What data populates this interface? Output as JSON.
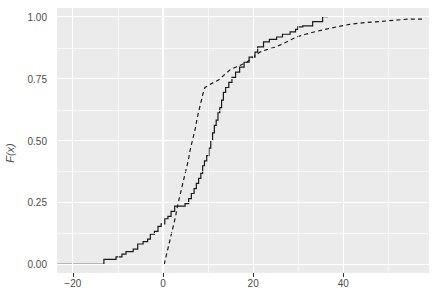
{
  "chart_data": {
    "type": "line",
    "title": "",
    "subtitle": "",
    "xlabel": "",
    "ylabel": "F(x)",
    "xlim": [
      -23.5,
      59.0
    ],
    "ylim": [
      -0.035,
      1.035
    ],
    "xticks": [
      -20,
      0,
      20,
      40
    ],
    "xticklabels": [
      "−20",
      "0",
      "20",
      "40"
    ],
    "yticks": [
      0.0,
      0.25,
      0.5,
      0.75,
      1.0
    ],
    "yticklabels": [
      "0.00",
      "0.25",
      "0.50",
      "0.75",
      "1.00"
    ],
    "x_minor_ticks": [
      -10,
      10,
      30,
      50
    ],
    "y_minor_ticks": [
      0.125,
      0.375,
      0.625,
      0.875
    ],
    "grid": true,
    "legend": "none",
    "panel_background": "#ebebeb",
    "grid_color": "#ffffff",
    "axis_text_color": "#4d4d4d",
    "series": [
      {
        "name": "empirical-ecdf",
        "style": "solid",
        "color": "#1a1a1a",
        "width": 1.2,
        "points": [
          [
            -23.4,
            0.0
          ],
          [
            -13.1,
            0.0
          ],
          [
            -13.1,
            0.02
          ],
          [
            -10.4,
            0.02
          ],
          [
            -10.4,
            0.03
          ],
          [
            -9.1,
            0.03
          ],
          [
            -9.1,
            0.041
          ],
          [
            -8.2,
            0.041
          ],
          [
            -8.2,
            0.051
          ],
          [
            -6.6,
            0.051
          ],
          [
            -6.6,
            0.061
          ],
          [
            -5.6,
            0.061
          ],
          [
            -5.6,
            0.082
          ],
          [
            -4.4,
            0.082
          ],
          [
            -4.4,
            0.092
          ],
          [
            -3.4,
            0.092
          ],
          [
            -3.4,
            0.102
          ],
          [
            -2.8,
            0.102
          ],
          [
            -2.8,
            0.122
          ],
          [
            -1.9,
            0.122
          ],
          [
            -1.9,
            0.133
          ],
          [
            -1.1,
            0.133
          ],
          [
            -1.1,
            0.153
          ],
          [
            -0.4,
            0.153
          ],
          [
            -0.4,
            0.163
          ],
          [
            0.4,
            0.163
          ],
          [
            0.4,
            0.184
          ],
          [
            1.1,
            0.184
          ],
          [
            1.1,
            0.194
          ],
          [
            1.8,
            0.194
          ],
          [
            1.8,
            0.214
          ],
          [
            2.6,
            0.214
          ],
          [
            2.6,
            0.235
          ],
          [
            4.9,
            0.235
          ],
          [
            4.9,
            0.245
          ],
          [
            5.7,
            0.245
          ],
          [
            5.7,
            0.265
          ],
          [
            6.3,
            0.265
          ],
          [
            6.3,
            0.286
          ],
          [
            6.9,
            0.286
          ],
          [
            6.9,
            0.306
          ],
          [
            7.4,
            0.306
          ],
          [
            7.4,
            0.327
          ],
          [
            7.9,
            0.327
          ],
          [
            7.9,
            0.347
          ],
          [
            8.4,
            0.347
          ],
          [
            8.4,
            0.367
          ],
          [
            8.8,
            0.367
          ],
          [
            8.8,
            0.398
          ],
          [
            9.2,
            0.398
          ],
          [
            9.2,
            0.418
          ],
          [
            9.7,
            0.418
          ],
          [
            9.7,
            0.439
          ],
          [
            10.2,
            0.439
          ],
          [
            10.2,
            0.469
          ],
          [
            10.6,
            0.469
          ],
          [
            10.6,
            0.5
          ],
          [
            11.0,
            0.5
          ],
          [
            11.0,
            0.531
          ],
          [
            11.4,
            0.531
          ],
          [
            11.4,
            0.561
          ],
          [
            11.8,
            0.561
          ],
          [
            11.8,
            0.582
          ],
          [
            12.2,
            0.582
          ],
          [
            12.2,
            0.612
          ],
          [
            12.6,
            0.612
          ],
          [
            12.6,
            0.633
          ],
          [
            13.0,
            0.633
          ],
          [
            13.0,
            0.663
          ],
          [
            13.4,
            0.663
          ],
          [
            13.4,
            0.694
          ],
          [
            13.9,
            0.694
          ],
          [
            13.9,
            0.714
          ],
          [
            14.6,
            0.714
          ],
          [
            14.6,
            0.735
          ],
          [
            15.3,
            0.735
          ],
          [
            15.3,
            0.755
          ],
          [
            16.1,
            0.755
          ],
          [
            16.1,
            0.776
          ],
          [
            17.0,
            0.776
          ],
          [
            17.0,
            0.796
          ],
          [
            18.0,
            0.796
          ],
          [
            18.0,
            0.816
          ],
          [
            19.1,
            0.816
          ],
          [
            19.1,
            0.837
          ],
          [
            20.4,
            0.837
          ],
          [
            20.4,
            0.857
          ],
          [
            21.0,
            0.857
          ],
          [
            21.0,
            0.878
          ],
          [
            22.3,
            0.878
          ],
          [
            22.3,
            0.898
          ],
          [
            23.6,
            0.898
          ],
          [
            23.6,
            0.908
          ],
          [
            25.2,
            0.908
          ],
          [
            25.2,
            0.918
          ],
          [
            26.5,
            0.918
          ],
          [
            26.5,
            0.929
          ],
          [
            28.2,
            0.929
          ],
          [
            28.2,
            0.939
          ],
          [
            29.4,
            0.939
          ],
          [
            29.4,
            0.949
          ],
          [
            29.9,
            0.949
          ],
          [
            29.9,
            0.959
          ],
          [
            31.0,
            0.959
          ],
          [
            31.0,
            0.963
          ],
          [
            33.2,
            0.963
          ],
          [
            33.2,
            0.98
          ],
          [
            35.4,
            0.98
          ],
          [
            35.4,
            1.0
          ],
          [
            36.6,
            1.0
          ]
        ]
      },
      {
        "name": "fitted-ecdf",
        "style": "dashed",
        "color": "#1a1a1a",
        "width": 1.2,
        "points": [
          [
            0.3,
            0.0
          ],
          [
            0.4,
            0.01
          ],
          [
            0.8,
            0.041
          ],
          [
            1.2,
            0.071
          ],
          [
            1.6,
            0.102
          ],
          [
            2.0,
            0.133
          ],
          [
            2.4,
            0.163
          ],
          [
            2.8,
            0.194
          ],
          [
            3.1,
            0.224
          ],
          [
            3.6,
            0.265
          ],
          [
            4.0,
            0.296
          ],
          [
            4.4,
            0.327
          ],
          [
            4.8,
            0.357
          ],
          [
            5.2,
            0.388
          ],
          [
            5.6,
            0.418
          ],
          [
            6.0,
            0.459
          ],
          [
            6.4,
            0.49
          ],
          [
            6.8,
            0.52
          ],
          [
            7.2,
            0.551
          ],
          [
            7.6,
            0.592
          ],
          [
            8.0,
            0.622
          ],
          [
            8.4,
            0.653
          ],
          [
            8.8,
            0.684
          ],
          [
            9.3,
            0.714
          ],
          [
            10.2,
            0.724
          ],
          [
            11.3,
            0.735
          ],
          [
            12.4,
            0.745
          ],
          [
            13.6,
            0.765
          ],
          [
            14.9,
            0.786
          ],
          [
            16.1,
            0.796
          ],
          [
            17.4,
            0.806
          ],
          [
            18.6,
            0.816
          ],
          [
            20.0,
            0.837
          ],
          [
            21.5,
            0.857
          ],
          [
            23.0,
            0.867
          ],
          [
            25.1,
            0.878
          ],
          [
            27.4,
            0.898
          ],
          [
            29.6,
            0.918
          ],
          [
            31.6,
            0.929
          ],
          [
            33.7,
            0.939
          ],
          [
            36.0,
            0.949
          ],
          [
            38.6,
            0.959
          ],
          [
            41.4,
            0.969
          ],
          [
            44.6,
            0.976
          ],
          [
            48.0,
            0.98
          ],
          [
            51.6,
            0.986
          ],
          [
            54.4,
            0.99
          ],
          [
            57.8,
            0.99
          ]
        ]
      }
    ]
  },
  "axes": {
    "y_title": "F(x)"
  }
}
